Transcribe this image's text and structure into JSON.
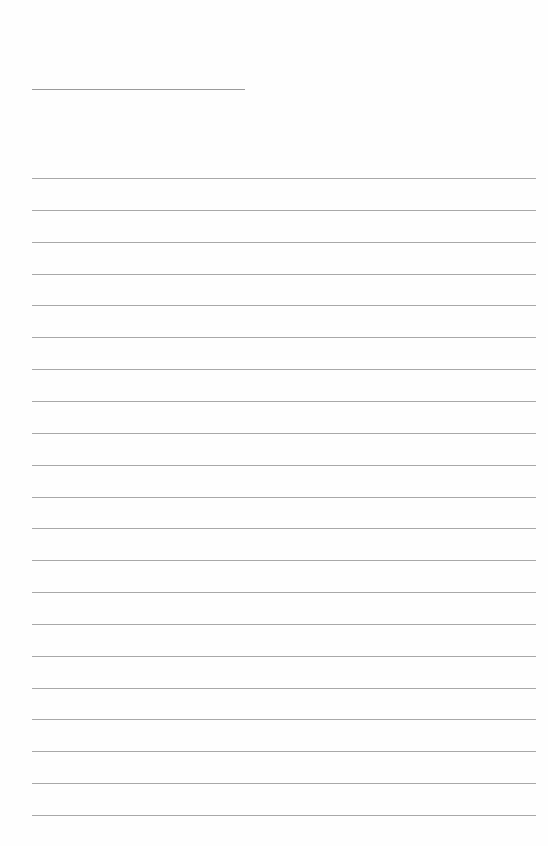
{
  "page": {
    "type": "blank lined paper",
    "header_line": {
      "label": ""
    },
    "ruled_lines_count": 21,
    "line_color": "#a8a8a8",
    "background_color": "#fefefe"
  }
}
